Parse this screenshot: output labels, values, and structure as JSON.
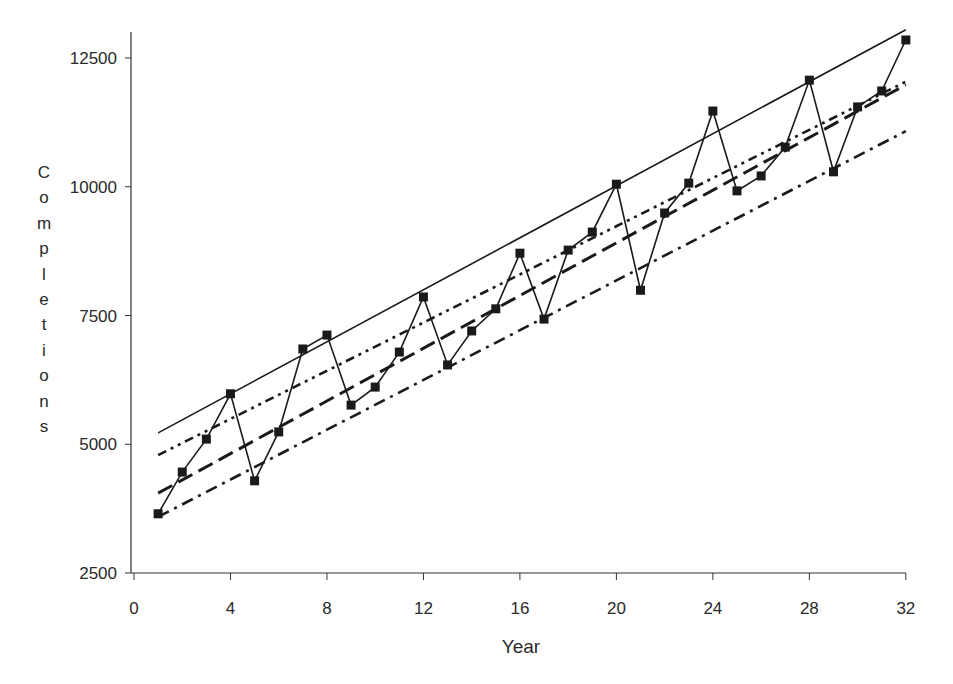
{
  "chart_data": {
    "type": "line",
    "title": "",
    "xlabel": "Year",
    "ylabel": "Completions",
    "xlim": [
      0,
      32
    ],
    "ylim": [
      2500,
      13000
    ],
    "x_ticks": [
      0,
      4,
      8,
      12,
      16,
      20,
      24,
      28,
      32
    ],
    "y_ticks": [
      2500,
      5000,
      7500,
      10000,
      12500
    ],
    "grid": false,
    "legend": null,
    "x": [
      1,
      2,
      3,
      4,
      5,
      6,
      7,
      8,
      9,
      10,
      11,
      12,
      13,
      14,
      15,
      16,
      17,
      18,
      19,
      20,
      21,
      22,
      23,
      24,
      25,
      26,
      27,
      28,
      29,
      30,
      31,
      32
    ],
    "series": [
      {
        "name": "Completions",
        "style": "solid-with-square-markers",
        "values": [
          3650,
          4460,
          5100,
          5980,
          4290,
          5240,
          6850,
          7120,
          5760,
          6110,
          6790,
          7860,
          6540,
          7200,
          7630,
          8710,
          7430,
          8770,
          9120,
          10050,
          7990,
          9490,
          10070,
          11470,
          9920,
          10210,
          10770,
          12070,
          10290,
          11550,
          11860,
          12850
        ]
      },
      {
        "name": "Trend (solid)",
        "style": "solid",
        "x": [
          1,
          32
        ],
        "values": [
          5220,
          13050
        ]
      },
      {
        "name": "Trend (dash-dot-dot)",
        "style": "dash-dot-dot",
        "x": [
          1,
          32
        ],
        "values": [
          4790,
          12040
        ]
      },
      {
        "name": "Trend (long dash)",
        "style": "long-dash",
        "x": [
          1,
          32
        ],
        "values": [
          4050,
          11980
        ]
      },
      {
        "name": "Trend (dash-dot)",
        "style": "dash-dot",
        "x": [
          1,
          32
        ],
        "values": [
          3590,
          11080
        ]
      }
    ]
  },
  "colors": {
    "ink": "#1a1a1a",
    "axis": "#333333",
    "background": "#ffffff"
  }
}
